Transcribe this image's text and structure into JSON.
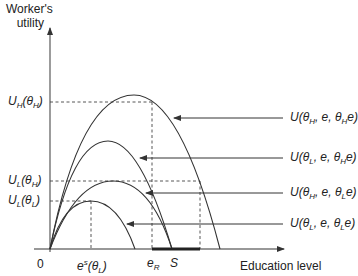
{
  "axes": {
    "y_label_line1": "Worker's",
    "y_label_line2": "utility",
    "x_label": "Education level",
    "origin": "0"
  },
  "y_ticks": {
    "UH_thetaH": {
      "main": "U",
      "sub": "H",
      "arg": "(θ",
      "argsub": "H",
      "close": ")"
    },
    "UL_thetaH": {
      "main": "U",
      "sub": "L",
      "arg": "(θ",
      "argsub": "H",
      "close": ")"
    },
    "UL_thetaL": {
      "main": "U",
      "sub": "L",
      "arg": "(θ",
      "argsub": "L",
      "close": ")"
    }
  },
  "x_ticks": {
    "es": {
      "main": "e",
      "sup": "s",
      "arg": "(θ",
      "argsub": "L",
      "close": ")"
    },
    "eR": {
      "main": "e",
      "sub": "R"
    },
    "S": "S"
  },
  "curve_labels": [
    {
      "text": "U(θ_H, e, θ_H e)",
      "pre": "U(θ",
      "s1": "H",
      "mid": ", e, θ",
      "s2": "H",
      "post": "e)"
    },
    {
      "text": "U(θ_L, e, θ_H e)",
      "pre": "U(θ",
      "s1": "L",
      "mid": ", e, θ",
      "s2": "H",
      "post": "e)"
    },
    {
      "text": "U(θ_H, e, θ_L e)",
      "pre": "U(θ",
      "s1": "H",
      "mid": ", e, θ",
      "s2": "L",
      "post": "e)"
    },
    {
      "text": "U(θ_L, e, θ_L e)",
      "pre": "U(θ",
      "s1": "L",
      "mid": ", e, θ",
      "s2": "L",
      "post": "e)"
    }
  ],
  "colors": {
    "line": "#333333",
    "axis": "#555555",
    "bar": "#222222"
  }
}
